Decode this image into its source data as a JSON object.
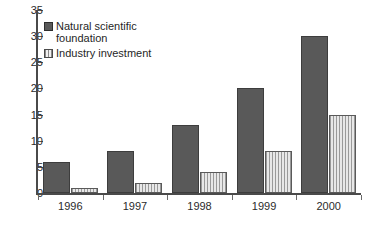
{
  "chart_data": {
    "type": "bar",
    "title": "",
    "subtitle": "",
    "xlabel": "",
    "ylabel": "",
    "categories": [
      "1996",
      "1997",
      "1998",
      "1999",
      "2000"
    ],
    "series": [
      {
        "name": "Natural scientific\nfoundation",
        "legend_label": "Natural scientific\nfoundation",
        "values": [
          6,
          8,
          13,
          20,
          30
        ],
        "color": "#595959",
        "pattern": "solid"
      },
      {
        "name": "Industry investment",
        "legend_label": "Industry investment",
        "values": [
          1,
          2,
          4,
          8,
          15
        ],
        "color": "#cfcfcf",
        "pattern": "vertical-stripes"
      }
    ],
    "ylim": [
      0,
      35
    ],
    "ytick_values": [
      0,
      5,
      10,
      15,
      20,
      25,
      30,
      35
    ],
    "ytick_labels": [
      "0",
      "5",
      "10",
      "15",
      "20",
      "25",
      "30",
      "35"
    ],
    "grid": false,
    "legend_position": "top-left-inside",
    "axis_color": "#4a4a4a",
    "background": "#ffffff"
  }
}
